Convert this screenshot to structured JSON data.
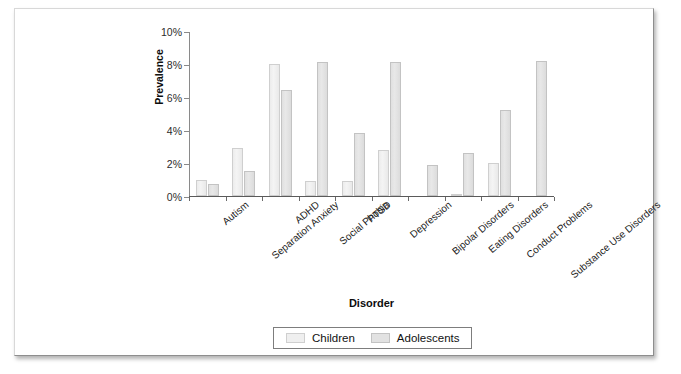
{
  "chart_data": {
    "type": "bar",
    "title": "",
    "xlabel": "Disorder",
    "ylabel": "Prevalence",
    "ylim": [
      0,
      10
    ],
    "ytick_labels": [
      "0%",
      "2%",
      "4%",
      "6%",
      "8%",
      "10%"
    ],
    "ytick_values": [
      0,
      2,
      4,
      6,
      8,
      10
    ],
    "grid": false,
    "legend_position": "bottom-center",
    "categories": [
      "Autism",
      "Separation Anxiety",
      "ADHD",
      "Social Phobia",
      "PTSD",
      "Depression",
      "Bipolar Disorders",
      "Eating Disorders",
      "Conduct Problems",
      "Substance Use Disorders"
    ],
    "series": [
      {
        "name": "Children",
        "color": "#efefef",
        "values": [
          1.0,
          2.9,
          8.0,
          0.9,
          0.9,
          2.8,
          0.0,
          0.1,
          2.0,
          0.0
        ]
      },
      {
        "name": "Adolescents",
        "color": "#e2e2e2",
        "values": [
          0.7,
          1.5,
          6.4,
          8.1,
          3.8,
          8.1,
          1.9,
          2.6,
          5.2,
          8.2
        ]
      }
    ]
  },
  "legend": {
    "entries": [
      {
        "label": "Children"
      },
      {
        "label": "Adolescents"
      }
    ]
  }
}
